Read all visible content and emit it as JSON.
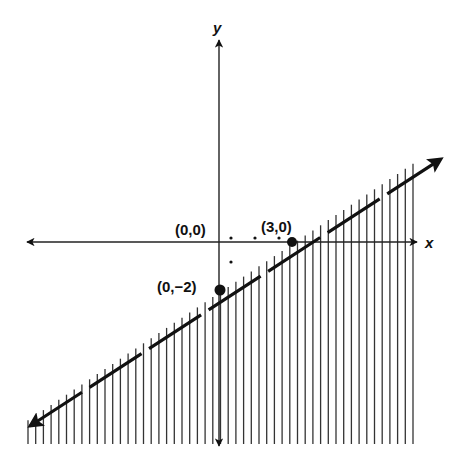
{
  "chart_data": {
    "type": "line",
    "title": "",
    "subtitle": "",
    "xlabel": "x",
    "ylabel": "y",
    "boundary": {
      "equation": "y = (2/3)x - 2",
      "slope": 0.6667,
      "intercept": -2,
      "style": "dashed",
      "arrows": "both"
    },
    "shaded_region": "below",
    "shading_style": "vertical hatching",
    "points": [
      {
        "label": "(0,0)",
        "x": 0,
        "y": 0,
        "marker": "none"
      },
      {
        "label": "(3,0)",
        "x": 3,
        "y": 0,
        "marker": "filled-dot"
      },
      {
        "label": "(0,−2)",
        "x": 0,
        "y": -2,
        "marker": "filled-dot"
      }
    ],
    "guide_dots": [
      {
        "x": 0.5,
        "y": 0
      },
      {
        "x": 1.5,
        "y": 0
      },
      {
        "x": 2.5,
        "y": 0
      },
      {
        "x": 0.5,
        "y": -1
      }
    ],
    "xlim": [
      -8,
      8.3
    ],
    "ylim": [
      -8.5,
      8.4
    ],
    "grid": false,
    "legend": null
  },
  "labels": {
    "x_axis": "x",
    "y_axis": "y",
    "origin": "(0,0)",
    "x_intercept": "(3,0)",
    "y_intercept": "(0,−2)"
  },
  "colors": {
    "ink": "#111111",
    "background": "#ffffff"
  }
}
